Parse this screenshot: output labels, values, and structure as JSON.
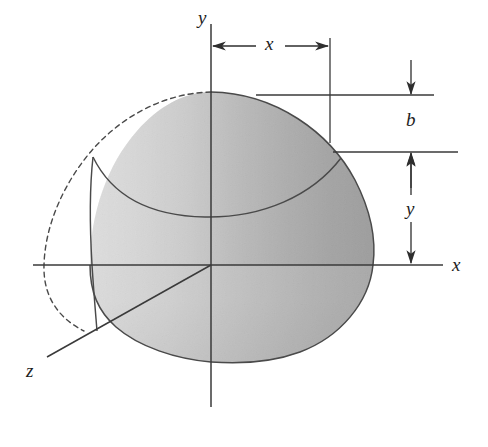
{
  "figure": {
    "background_color": "#ffffff",
    "line_color": "#3a3a3a",
    "width": 488,
    "height": 447
  },
  "axes": [
    {
      "name": "y-axis",
      "label": "y",
      "label_x": 198,
      "label_y": 8,
      "orientation": "vertical"
    },
    {
      "name": "x-axis",
      "label": "x",
      "label_x": 452,
      "label_y": 255,
      "orientation": "horizontal"
    },
    {
      "name": "z-axis",
      "label": "z",
      "label_x": 26,
      "label_y": 361,
      "orientation": "oblique"
    }
  ],
  "dimensions": [
    {
      "name": "x-dimension",
      "label": "x",
      "label_x": 262,
      "label_y": 34,
      "orientation": "horizontal",
      "arrow_style": "double-inward"
    },
    {
      "name": "b-dimension",
      "label": "b",
      "label_x": 403,
      "label_y": 110,
      "orientation": "vertical",
      "arrow_style": "double-outward"
    },
    {
      "name": "y-dimension",
      "label": "y",
      "label_x": 403,
      "label_y": 199,
      "orientation": "vertical",
      "arrow_style": "double-outward"
    }
  ],
  "geometry": {
    "origin": {
      "x": 211,
      "y": 265
    },
    "apex": {
      "x": 211,
      "y": 92
    },
    "right_extent": {
      "x": 373,
      "y": 265
    },
    "bottom_extent": {
      "x": 211,
      "y": 362
    },
    "dashed_arc_left": {
      "x": 44,
      "y": 265
    }
  },
  "shading": {
    "light_tone": "#e8e8e8",
    "mid_tone": "#b9b9b9",
    "dark_tone": "#6e6e6e",
    "darkest_tone": "#5a5a5a"
  }
}
